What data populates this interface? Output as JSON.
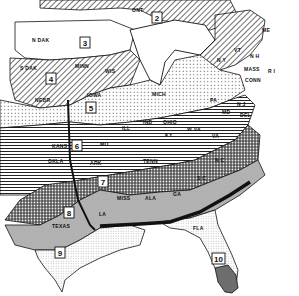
{
  "map": {
    "title": "",
    "zones": [
      {
        "number": "2",
        "label": "2"
      },
      {
        "number": "3",
        "label": "3"
      },
      {
        "number": "4",
        "label": "4"
      },
      {
        "number": "5",
        "label": "5"
      },
      {
        "number": "6",
        "label": "6"
      },
      {
        "number": "7",
        "label": "7"
      },
      {
        "number": "8",
        "label": "8"
      },
      {
        "number": "9",
        "label": "9"
      },
      {
        "number": "10",
        "label": "10"
      }
    ],
    "states": {
      "n_dak": "N DAK",
      "s_dak": "S DAK",
      "nebr": "NEBR",
      "kans": "KANS",
      "okla": "OKLA",
      "texas": "TEXAS",
      "minn": "MINN",
      "iowa": "IOWA",
      "mo": "MO",
      "ark": "ARK",
      "la": "LA",
      "wis": "WIS",
      "ill": "ILL",
      "ind": "IND",
      "ohio": "OHIO",
      "mich": "MICH",
      "ky": "KY",
      "tenn": "TENN",
      "miss": "MISS",
      "ala": "ALA",
      "ga": "GA",
      "fla": "FLA",
      "s_c": "S C",
      "n_c": "N C",
      "va": "VA",
      "w_va": "W VA",
      "pa": "PA",
      "n_y": "N Y",
      "n_j": "N J",
      "del": "DEL",
      "md": "MD",
      "conn": "CONN",
      "mass": "MASS",
      "r_i": "R I",
      "vt": "VT",
      "n_h": "N H",
      "me": "ME",
      "ont": "ONT"
    }
  }
}
